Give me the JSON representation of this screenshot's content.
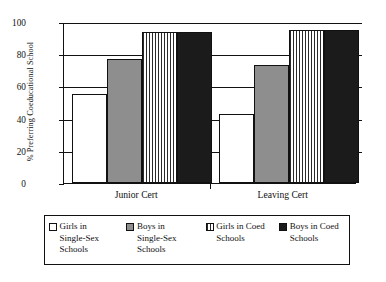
{
  "chart_data": {
    "type": "bar",
    "title": "",
    "xlabel": "",
    "ylabel": "% Preferring Coeducational School",
    "categories": [
      "Junior Cert",
      "Leaving Cert"
    ],
    "series": [
      {
        "name": "Girls in Single-Sex Schools",
        "values": [
          55,
          43
        ],
        "fill": "white",
        "color": "#ffffff"
      },
      {
        "name": "Boys in Single-Sex Schools",
        "values": [
          77,
          73
        ],
        "fill": "gray",
        "color": "#8e8e8e"
      },
      {
        "name": "Girls in Coed Schools",
        "values": [
          94,
          95
        ],
        "fill": "stripe",
        "color": "#2a2a2a"
      },
      {
        "name": "Boys in Coed Schools",
        "values": [
          94,
          95
        ],
        "fill": "black",
        "color": "#1b1b1b"
      }
    ],
    "ylim": [
      0,
      100
    ],
    "yticks": [
      0,
      20,
      40,
      60,
      80,
      100
    ],
    "grid": true,
    "legend_position": "bottom"
  },
  "axes": {
    "y_title": "% Preferring Coeducational School",
    "y_tick_labels": [
      "0",
      "20",
      "40",
      "60",
      "80",
      "100"
    ],
    "x_tick_labels": [
      "Junior Cert",
      "Leaving Cert"
    ]
  },
  "legend": {
    "entries": [
      {
        "label": "Girls in\nSingle-Sex\nSchools"
      },
      {
        "label": "Boys in\nSingle-Sex\nSchools"
      },
      {
        "label": "Girls in Coed\nSchools"
      },
      {
        "label": "Boys in Coed\nSchools"
      }
    ]
  }
}
